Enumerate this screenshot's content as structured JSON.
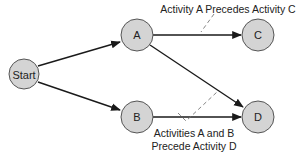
{
  "diagram": {
    "type": "activity-on-node precedence network",
    "nodes": [
      {
        "id": "start",
        "label": "Start",
        "cx": 24,
        "cy": 74,
        "r": 16
      },
      {
        "id": "a",
        "label": "A",
        "cx": 137,
        "cy": 35,
        "r": 16
      },
      {
        "id": "b",
        "label": "B",
        "cx": 137,
        "cy": 117,
        "r": 16
      },
      {
        "id": "c",
        "label": "C",
        "cx": 258,
        "cy": 35,
        "r": 16
      },
      {
        "id": "d",
        "label": "D",
        "cx": 258,
        "cy": 117,
        "r": 16
      }
    ],
    "edges": [
      {
        "from": "start",
        "to": "a"
      },
      {
        "from": "start",
        "to": "b"
      },
      {
        "from": "a",
        "to": "c"
      },
      {
        "from": "a",
        "to": "d"
      },
      {
        "from": "b",
        "to": "d"
      }
    ],
    "annotations": [
      {
        "id": "a-precedes-c",
        "lines": [
          "Activity A Precedes Activity C"
        ]
      },
      {
        "id": "ab-precede-d",
        "lines": [
          "Activities A and B",
          "Precede Activity D"
        ]
      }
    ],
    "colors": {
      "node_fill": "#d4d4d4",
      "node_stroke": "#555555",
      "edge": "#1a1a1a",
      "dash": "#777777"
    }
  }
}
